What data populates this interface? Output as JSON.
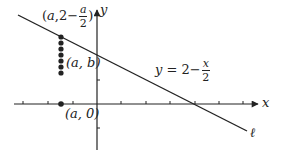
{
  "diagram": {
    "title": "",
    "colors": {
      "stroke": "#222222",
      "background": "#ffffff"
    },
    "axes": {
      "x_label": "x",
      "y_label": "y",
      "origin_px": [
        97,
        104
      ],
      "unit_px": 24.5,
      "x_ticks": [
        -3,
        -2,
        -1,
        1,
        2,
        3,
        4,
        5,
        6
      ],
      "y_ticks": [
        1,
        -1
      ]
    },
    "line": {
      "name_label": "ℓ",
      "equation": {
        "lhs": "y",
        "eq": "=",
        "const": "2",
        "minus": "−",
        "frac_num": "x",
        "frac_den": "2"
      },
      "slope": -0.5,
      "y_intercept": 2
    },
    "points": {
      "top": {
        "open": "(",
        "var": "a",
        "comma": ",",
        "const": "2",
        "minus": "−",
        "frac_num": "a",
        "frac_den": "2",
        "close": ")"
      },
      "middle": {
        "text": "(a, b)"
      },
      "bottom": {
        "text": "(a, 0)"
      },
      "a_value": -1.47,
      "dot_count_vertical": 7
    }
  }
}
